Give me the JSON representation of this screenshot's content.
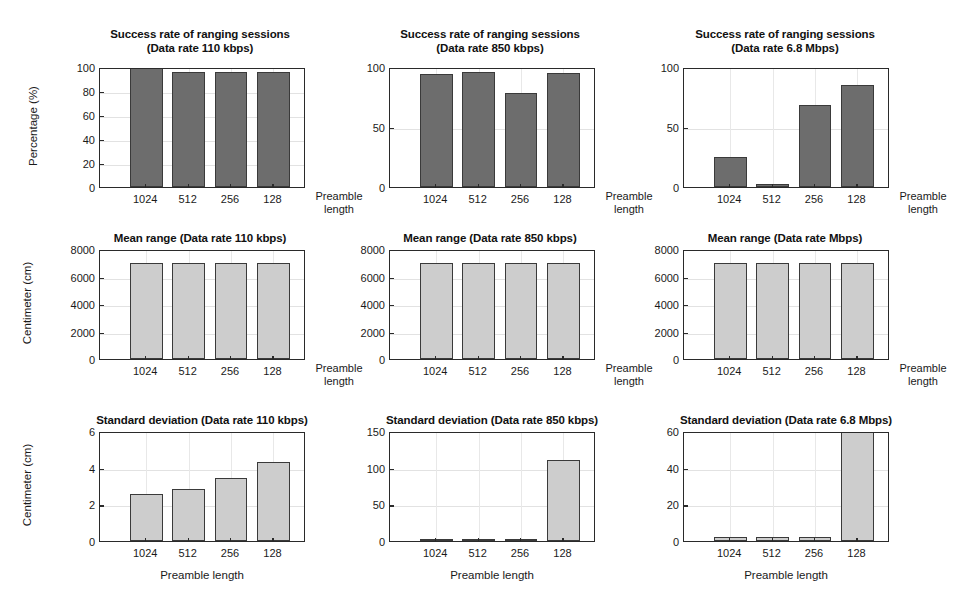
{
  "figure": {
    "categories": [
      "1024",
      "512",
      "256",
      "128"
    ],
    "x_axis_label_right": "Preamble\nlength",
    "x_axis_label_below": "Preamble length",
    "colors": {
      "dark_bar_fill": "#6d6d6d",
      "light_bar_fill": "#cdcdcd",
      "bar_edge": "#3a3a3a",
      "axis": "#2a2a2a",
      "gridline": "#e2e2e2",
      "background": "#ffffff"
    }
  },
  "chart_data": [
    {
      "id": "success-110kbps",
      "type": "bar",
      "title": "Success rate of ranging sessions\n(Data rate 110 kbps)",
      "xlabel": "Preamble length",
      "ylabel": "Percentage (%)",
      "categories": [
        "1024",
        "512",
        "256",
        "128"
      ],
      "values": [
        100,
        96,
        96,
        96
      ],
      "ylim": [
        0,
        100
      ],
      "yticks": [
        0,
        20,
        40,
        60,
        80,
        100
      ],
      "ytick_labels": [
        "0",
        "20",
        "40",
        "60",
        "80",
        "100"
      ],
      "grid": true,
      "bar_style": "dark"
    },
    {
      "id": "success-850kbps",
      "type": "bar",
      "title": "Success rate of ranging sessions\n(Data rate 850 kbps)",
      "xlabel": "Preamble length",
      "ylabel": "",
      "categories": [
        "1024",
        "512",
        "256",
        "128"
      ],
      "values": [
        94,
        96,
        78,
        95
      ],
      "ylim": [
        0,
        100
      ],
      "yticks": [
        0,
        50,
        100
      ],
      "ytick_labels": [
        "0",
        "50",
        "100"
      ],
      "grid": true,
      "bar_style": "dark"
    },
    {
      "id": "success-6800kbps",
      "type": "bar",
      "title": "Success rate of ranging sessions\n(Data rate 6.8 Mbps)",
      "xlabel": "Preamble length",
      "ylabel": "",
      "categories": [
        "1024",
        "512",
        "256",
        "128"
      ],
      "values": [
        25,
        2.5,
        68,
        85
      ],
      "ylim": [
        0,
        100
      ],
      "yticks": [
        0,
        50,
        100
      ],
      "ytick_labels": [
        "0",
        "50",
        "100"
      ],
      "grid": true,
      "bar_style": "dark"
    },
    {
      "id": "mean-range-110kbps",
      "type": "bar",
      "title": "Mean range (Data rate 110 kbps)",
      "xlabel": "Preamble length",
      "ylabel": "Centimeter (cm)",
      "categories": [
        "1024",
        "512",
        "256",
        "128"
      ],
      "values": [
        7000,
        6990,
        6980,
        6960
      ],
      "ylim": [
        0,
        8000
      ],
      "yticks": [
        0,
        2000,
        4000,
        6000,
        8000
      ],
      "ytick_labels": [
        "0",
        "2000",
        "4000",
        "6000",
        "8000"
      ],
      "grid": true,
      "bar_style": "light"
    },
    {
      "id": "mean-range-850kbps",
      "type": "bar",
      "title": "Mean range (Data rate 850 kbps)",
      "xlabel": "Preamble length",
      "ylabel": "",
      "categories": [
        "1024",
        "512",
        "256",
        "128"
      ],
      "values": [
        7010,
        7000,
        6985,
        6955
      ],
      "ylim": [
        0,
        8000
      ],
      "yticks": [
        0,
        2000,
        4000,
        6000,
        8000
      ],
      "ytick_labels": [
        "0",
        "2000",
        "4000",
        "6000",
        "8000"
      ],
      "grid": true,
      "bar_style": "light"
    },
    {
      "id": "mean-range-6800kbps",
      "type": "bar",
      "title": "Mean range (Data rate Mbps)",
      "xlabel": "Preamble length",
      "ylabel": "",
      "categories": [
        "1024",
        "512",
        "256",
        "128"
      ],
      "values": [
        6995,
        6995,
        6990,
        6955
      ],
      "ylim": [
        0,
        8000
      ],
      "yticks": [
        0,
        2000,
        4000,
        6000,
        8000
      ],
      "ytick_labels": [
        "0",
        "2000",
        "4000",
        "6000",
        "8000"
      ],
      "grid": true,
      "bar_style": "light"
    },
    {
      "id": "std-110kbps",
      "type": "bar",
      "title": "Standard deviation (Data rate 110 kbps)",
      "xlabel": "Preamble length",
      "ylabel": "Centimeter (cm)",
      "categories": [
        "1024",
        "512",
        "256",
        "128"
      ],
      "values": [
        2.55,
        2.85,
        3.45,
        4.3
      ],
      "ylim": [
        0,
        6
      ],
      "yticks": [
        0,
        2,
        4,
        6
      ],
      "ytick_labels": [
        "0",
        "2",
        "4",
        "6"
      ],
      "grid": true,
      "bar_style": "light"
    },
    {
      "id": "std-850kbps",
      "type": "bar",
      "title": "Standard deviation (Data rate 850 kbps)",
      "xlabel": "Preamble length",
      "ylabel": "",
      "categories": [
        "1024",
        "512",
        "256",
        "128"
      ],
      "values": [
        2.5,
        2.3,
        2.4,
        110
      ],
      "ylim": [
        0,
        150
      ],
      "yticks": [
        0,
        50,
        100,
        150
      ],
      "ytick_labels": [
        "0",
        "50",
        "100",
        "150"
      ],
      "grid": true,
      "bar_style": "light"
    },
    {
      "id": "std-6800kbps",
      "type": "bar",
      "title": "Standard deviation (Data rate 6.8 Mbps)",
      "xlabel": "Preamble length",
      "ylabel": "Centimeter (cm)",
      "categories": [
        "1024",
        "512",
        "256",
        "128"
      ],
      "values": [
        2.3,
        2.3,
        2.3,
        60
      ],
      "ylim": [
        0,
        60
      ],
      "yticks": [
        0,
        20,
        40,
        60
      ],
      "ytick_labels": [
        "0",
        "20",
        "40",
        "60"
      ],
      "grid": true,
      "bar_style": "light"
    }
  ]
}
